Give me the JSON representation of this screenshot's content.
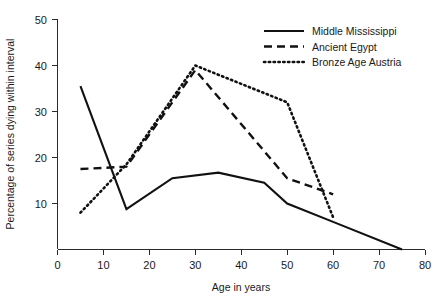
{
  "chart_data": {
    "type": "line",
    "title": "",
    "xlabel": "Age in years",
    "ylabel": "Percentage of series dying within interval",
    "xlim": [
      0,
      80
    ],
    "ylim": [
      0,
      50
    ],
    "xticks": [
      0,
      10,
      20,
      30,
      40,
      50,
      60,
      70,
      80
    ],
    "yticks": [
      10,
      20,
      30,
      40,
      50
    ],
    "xtick_labels": [
      "0",
      "10",
      "20",
      "30",
      "40",
      "50",
      "60",
      "70",
      "80"
    ],
    "ytick_labels": [
      "10",
      "20",
      "30",
      "40",
      "50"
    ],
    "grid": false,
    "legend_position": "top-right",
    "series": [
      {
        "name": "Middle Mississippi",
        "style": "solid",
        "color": "#111111",
        "x": [
          5,
          15,
          25,
          35,
          45,
          50,
          60,
          75
        ],
        "y": [
          35.5,
          8.8,
          15.5,
          16.7,
          14.5,
          10.0,
          6.0,
          0.0
        ]
      },
      {
        "name": "Ancient Egypt",
        "style": "dashed",
        "color": "#111111",
        "x": [
          5,
          15,
          30,
          50,
          60
        ],
        "y": [
          17.5,
          18.0,
          39.0,
          15.5,
          12.0
        ]
      },
      {
        "name": "Bronze Age Austria",
        "style": "dotted",
        "color": "#111111",
        "x": [
          5,
          15,
          30,
          50,
          60
        ],
        "y": [
          8.0,
          18.5,
          40.0,
          32.0,
          7.0
        ]
      }
    ]
  },
  "legend": {
    "entries": [
      {
        "label": "Middle Mississippi",
        "style": "solid"
      },
      {
        "label": "Ancient Egypt",
        "style": "dashed"
      },
      {
        "label": "Bronze Age Austria",
        "style": "dotted"
      }
    ]
  }
}
